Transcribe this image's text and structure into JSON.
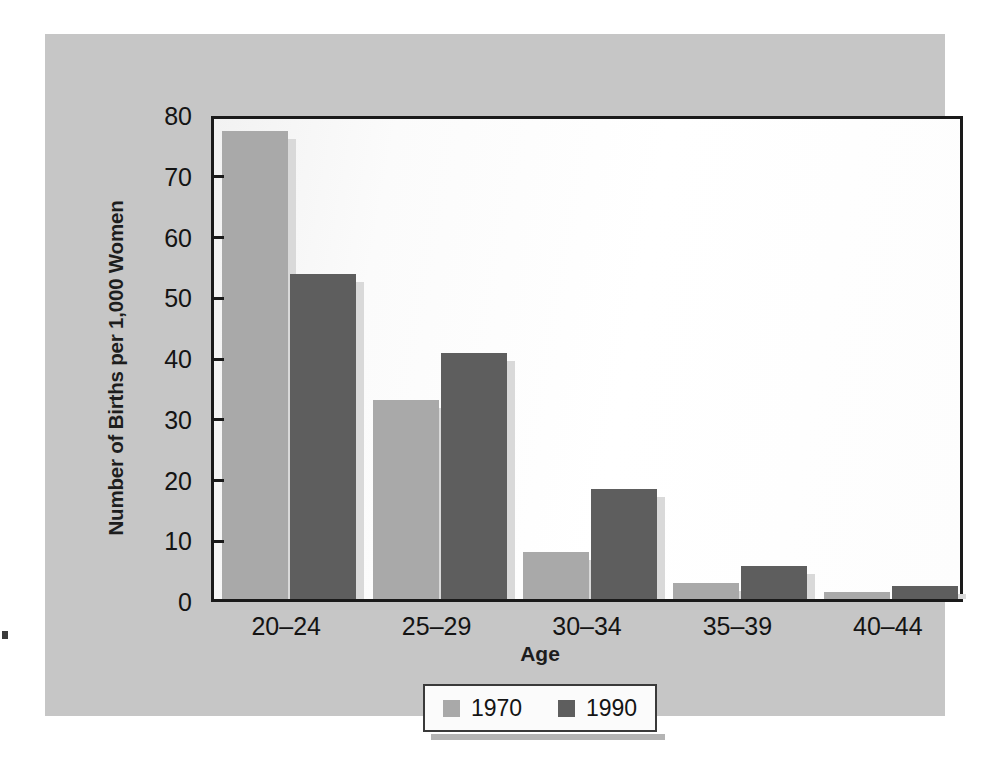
{
  "chart_data": {
    "type": "bar",
    "title": "",
    "xlabel": "Age",
    "ylabel": "Number of Births per 1,000 Women",
    "categories": [
      "20–24",
      "25–29",
      "30–34",
      "35–39",
      "40–44"
    ],
    "ylim": [
      0,
      80
    ],
    "yticks": [
      0,
      10,
      20,
      30,
      40,
      50,
      60,
      70,
      80
    ],
    "ytick_labels": [
      "0",
      "10",
      "20",
      "30",
      "40",
      "50",
      "60",
      "70",
      "80"
    ],
    "grid": false,
    "legend_position": "bottom-center",
    "series": [
      {
        "name": "1970",
        "color": "#a9a9a9",
        "values": [
          77.0,
          32.8,
          7.8,
          2.7,
          1.2
        ]
      },
      {
        "name": "1990",
        "color": "#5e5e5e",
        "values": [
          53.5,
          40.5,
          18.1,
          5.4,
          2.2
        ]
      }
    ]
  },
  "legend": {
    "entries": [
      {
        "label": "1970",
        "swatch": "legend-swatch-1970"
      },
      {
        "label": "1990",
        "swatch": "legend-swatch-1990"
      }
    ]
  },
  "colors": {
    "panel_background": "#c6c6c6",
    "plot_background": "#ffffff",
    "axis": "#1a1a1a",
    "series_1970": "#a9a9a9",
    "series_1990": "#5e5e5e",
    "bar_shadow": "#d9d9d9"
  }
}
